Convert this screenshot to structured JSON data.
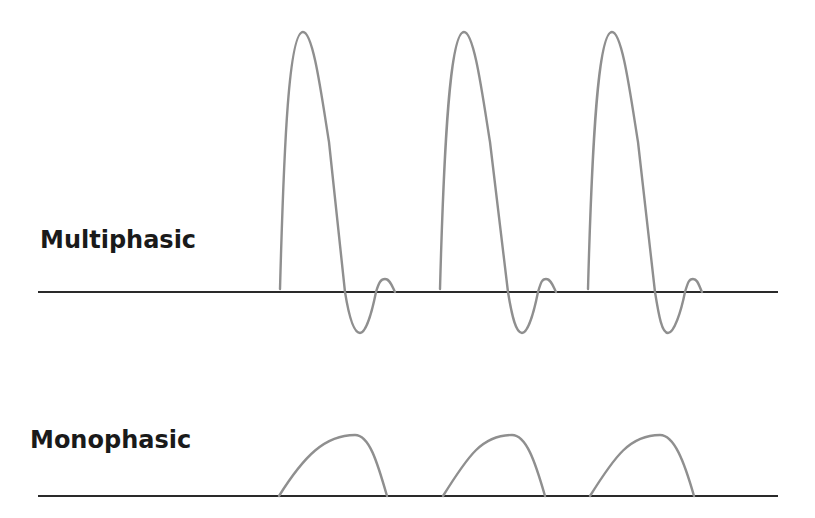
{
  "panels": {
    "multiphasic": {
      "label": "Multiphasic",
      "baseline_y": 292,
      "baseline_x": [
        38,
        778
      ],
      "wave_color": "#8f8f8f",
      "baseline_color": "#2a2a2a",
      "waves": [
        {
          "start_x": 280,
          "peak": [
            303,
            32
          ],
          "cross1_x": 345,
          "trough": [
            360,
            333
          ],
          "cross2_x": 376,
          "bump": [
            385,
            279
          ],
          "end_x": 395
        },
        {
          "start_x": 440,
          "peak": [
            464,
            32
          ],
          "cross1_x": 508,
          "trough": [
            522,
            333
          ],
          "cross2_x": 538,
          "bump": [
            546,
            279
          ],
          "end_x": 556
        },
        {
          "start_x": 588,
          "peak": [
            612,
            32
          ],
          "cross1_x": 655,
          "trough": [
            668,
            333
          ],
          "cross2_x": 685,
          "bump": [
            693,
            279
          ],
          "end_x": 702
        }
      ]
    },
    "monophasic": {
      "label": "Monophasic",
      "baseline_y": 496,
      "baseline_x": [
        38,
        778
      ],
      "wave_color": "#8f8f8f",
      "baseline_color": "#2a2a2a",
      "waves": [
        {
          "start_x": 279,
          "peak": [
            355,
            435
          ],
          "end_x": 387
        },
        {
          "start_x": 443,
          "peak": [
            512,
            435
          ],
          "end_x": 545
        },
        {
          "start_x": 590,
          "peak": [
            660,
            435
          ],
          "end_x": 694
        }
      ]
    }
  }
}
